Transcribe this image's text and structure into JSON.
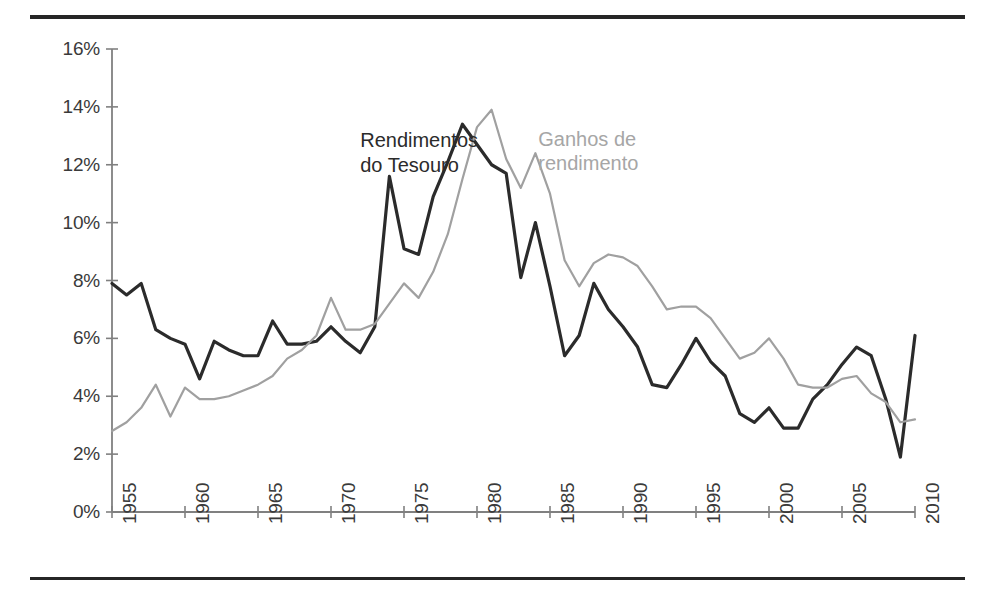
{
  "chart_data": {
    "type": "line",
    "title": "",
    "subtitle": "",
    "xlabel": "",
    "ylabel": "",
    "xlim": [
      1955,
      2010
    ],
    "ylim": [
      0,
      16
    ],
    "grid": false,
    "legend_position": "inline-annotations",
    "x": [
      1955,
      1956,
      1957,
      1958,
      1959,
      1960,
      1961,
      1962,
      1963,
      1964,
      1965,
      1966,
      1967,
      1968,
      1969,
      1970,
      1971,
      1972,
      1973,
      1974,
      1975,
      1976,
      1977,
      1978,
      1979,
      1980,
      1981,
      1982,
      1983,
      1984,
      1985,
      1986,
      1987,
      1988,
      1989,
      1990,
      1991,
      1992,
      1993,
      1994,
      1995,
      1996,
      1997,
      1998,
      1999,
      2000,
      2001,
      2002,
      2003,
      2004,
      2005,
      2006,
      2007,
      2008,
      2009,
      2010
    ],
    "xtick_labels": [
      "1955",
      "1960",
      "1965",
      "1970",
      "1975",
      "1980",
      "1985",
      "1990",
      "1995",
      "2000",
      "2005",
      "2010"
    ],
    "xticks": [
      1955,
      1960,
      1965,
      1970,
      1975,
      1980,
      1985,
      1990,
      1995,
      2000,
      2005,
      2010
    ],
    "ytick_labels": [
      "0%",
      "2%",
      "4%",
      "6%",
      "8%",
      "10%",
      "12%",
      "14%",
      "16%"
    ],
    "yticks": [
      0,
      2,
      4,
      6,
      8,
      10,
      12,
      14,
      16
    ],
    "series": [
      {
        "name": "Rendimentos do Tesouro",
        "color": "#2b2b2b",
        "width": 3.2,
        "label_lines": [
          "Rendimentos",
          "do Tesouro"
        ],
        "label_x": 1972.0,
        "label_y": 12.85,
        "values": [
          7.9,
          7.5,
          7.9,
          6.3,
          6.0,
          5.8,
          4.6,
          5.9,
          5.6,
          5.4,
          5.4,
          6.6,
          5.8,
          5.8,
          5.9,
          6.4,
          5.9,
          5.5,
          6.4,
          11.6,
          9.1,
          8.9,
          10.9,
          12.1,
          13.4,
          12.7,
          12.0,
          11.7,
          8.1,
          10.0,
          7.8,
          5.4,
          6.1,
          7.9,
          7.0,
          6.4,
          5.7,
          4.4,
          4.3,
          5.1,
          6.0,
          5.2,
          4.7,
          3.4,
          3.1,
          3.6,
          2.9,
          2.9,
          3.9,
          4.4,
          5.1,
          5.7,
          5.4,
          3.9,
          1.9,
          6.1
        ]
      },
      {
        "name": "Ganhos de rendimento",
        "color": "#a0a0a0",
        "width": 2.2,
        "label_lines": [
          "Ganhos de",
          "rendimento"
        ],
        "label_x": 1984.2,
        "label_y": 12.9,
        "values": [
          2.8,
          3.1,
          3.6,
          4.4,
          3.3,
          4.3,
          3.9,
          3.9,
          4.0,
          4.2,
          4.4,
          4.7,
          5.3,
          5.6,
          6.1,
          7.4,
          6.3,
          6.3,
          6.5,
          7.2,
          7.9,
          7.4,
          8.3,
          9.6,
          11.5,
          13.3,
          13.9,
          12.2,
          11.2,
          12.4,
          11.0,
          8.7,
          7.8,
          8.6,
          8.9,
          8.8,
          8.5,
          7.8,
          7.0,
          7.1,
          7.1,
          6.7,
          6.0,
          5.3,
          5.5,
          6.0,
          5.3,
          4.4,
          4.3,
          4.3,
          4.6,
          4.7,
          4.1,
          3.8,
          3.1,
          3.2
        ]
      }
    ]
  },
  "figure": {
    "rule_color": "#262626",
    "axis_color": "#808080",
    "background": "#ffffff"
  }
}
